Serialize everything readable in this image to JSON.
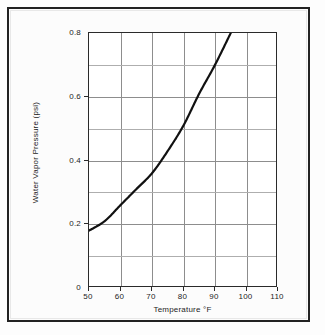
{
  "chart_data": {
    "type": "line",
    "title": "",
    "xlabel": "Temperature °F",
    "ylabel": "Water Vapor Pressure (psi)",
    "xlim": [
      50,
      110
    ],
    "ylim": [
      0,
      0.8
    ],
    "xticks": [
      50,
      60,
      70,
      80,
      90,
      100,
      110
    ],
    "xticklabels": [
      "50",
      "60",
      "70",
      "80",
      "90",
      "100",
      "110"
    ],
    "yticks": [
      0,
      0.2,
      0.4,
      0.6,
      0.8
    ],
    "yticklabels": [
      "0",
      "0.2",
      "0.4",
      "0.6",
      "0.8"
    ],
    "y_minor_gridlines": [
      0.1,
      0.3,
      0.5,
      0.7
    ],
    "grid": true,
    "legend": null,
    "series": [
      {
        "name": "Water vapor pressure",
        "color": "#111111",
        "linewidth": 2.2,
        "x": [
          50,
          55,
          60,
          65,
          70,
          75,
          80,
          85,
          90,
          95
        ],
        "y": [
          0.18,
          0.21,
          0.26,
          0.31,
          0.36,
          0.43,
          0.51,
          0.61,
          0.7,
          0.8
        ]
      }
    ]
  },
  "axis": {
    "x_tick_labels": [
      "50",
      "60",
      "70",
      "80",
      "90",
      "100",
      "110"
    ],
    "y_tick_labels": [
      "0.8",
      "0.6",
      "0.4",
      "0.2",
      "0"
    ],
    "x_axis_title": "Temperature °F",
    "y_axis_title": "Water Vapor Pressure (psi)"
  }
}
